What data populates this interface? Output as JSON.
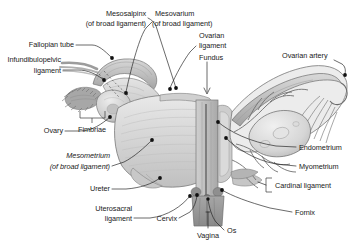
{
  "figure": {
    "background_color": "#ffffff",
    "label_color": "#1a1a1a",
    "leader_color": "#1a1a1a"
  },
  "labels": {
    "mesosalpinx_1": "Mesosalpinx",
    "mesosalpinx_2": "(of broad ligament)",
    "fallopian_tube": "Fallopian tube",
    "infundibulopelvic_1": "Infundibulopelvic",
    "infundibulopelvic_2": "ligament",
    "fimbriae": "Fimbriae",
    "ovary": "Ovary",
    "mesometrium_1": "Mesometrium",
    "mesometrium_2": "(of broad ligament)",
    "ureter": "Ureter",
    "uterosacral_1": "Uterosacral",
    "uterosacral_2": "ligament",
    "cervix": "Cervix",
    "vagina": "Vagina",
    "os": "Os",
    "mesovarium_1": "Mesovarium",
    "mesovarium_2": "(of broad ligament)",
    "ovarian_ligament_1": "Ovarian",
    "ovarian_ligament_2": "ligament",
    "fundus": "Fundus",
    "ovarian_artery": "Ovarian artery",
    "endometrium": "Endometrium",
    "myometrium": "Myometrium",
    "cardinal_ligament": "Cardinal ligament",
    "fornix": "Fornix"
  },
  "palette": {
    "tissue_light": "#dedede",
    "tissue_mid": "#c4c4c4",
    "tissue_dark": "#9a9a9a",
    "outline": "#6f6f6f",
    "outline_dark": "#4a4a4a",
    "vagina_dark": "#8e8e8e",
    "highlight": "#efefef"
  }
}
